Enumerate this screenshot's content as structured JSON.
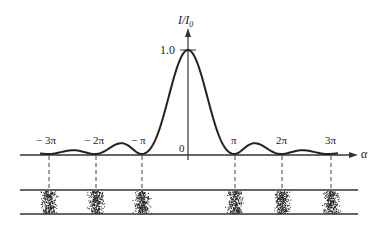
{
  "figure": {
    "y_axis_label": "I/I",
    "y_axis_sub": "0",
    "x_axis_label": "α",
    "peak_label": "1.0",
    "origin_label": "0",
    "tick_labels": [
      "− 3π",
      "− 2π",
      "− π",
      "π",
      "2π",
      "3π"
    ]
  },
  "chart_data": {
    "type": "line",
    "xlabel": "α",
    "ylabel": "I/I₀",
    "function": "I/I0 = (sin α / α)^2",
    "x_ticks": [
      "-3π",
      "-2π",
      "-π",
      "0",
      "π",
      "2π",
      "3π"
    ],
    "ylim": [
      0,
      1.0
    ],
    "y_ticks": [
      "0",
      "1.0"
    ],
    "minima_at": [
      "-3π",
      "-2π",
      "-π",
      "π",
      "2π",
      "3π"
    ],
    "central_max": 1.0,
    "secondary_max_approx": 0.047,
    "fringe_band": "dark fringes at minima positions shown as stippled bands between two horizontal lines"
  }
}
